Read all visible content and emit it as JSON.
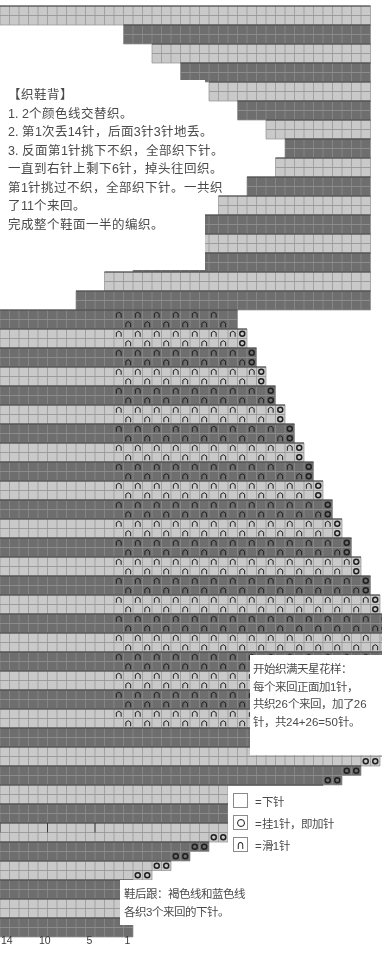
{
  "document": {
    "type": "knitting-chart",
    "title_block": "【织鞋背】"
  },
  "instructions": {
    "heading": "【织鞋背】",
    "lines": [
      "【织鞋背】",
      "1. 2个颜色线交替织。",
      "2. 第1次丢14针，后面3针3针地丢。",
      "3. 反面第1针挑下不织，全部织下针。",
      "一直到右针上剩下6针，掉头往回织。",
      "第1针挑过不织，全部织下针。一共织",
      "了11个来回。",
      "完成整个鞋面一半的编织。"
    ],
    "text": "【织鞋背】\n1. 2个颜色线交替织。\n2. 第1次丢14针，后面3针3针地丢。\n3. 反面第1针挑下不织，全部织下针。\n一直到右针上剩下6针，掉头往回织。\n第1针挑过不织，全部织下针。一共织\n了11个来回。\n完成整个鞋面一半的编织。"
  },
  "star_pattern_note": {
    "lines": [
      "开始织满天星花样：",
      "每个来回正面加1针，",
      "共织26个来回，加了26",
      "针，共24+26=50针。"
    ],
    "text": "开始织满天星花样：\n每个来回正面加1针，\n共织26个来回，加了26\n针，共24+26=50针。"
  },
  "heel_note": {
    "lines": [
      "鞋后跟：褐色线和蓝色线",
      "各织3个来回的下针。"
    ],
    "text": "鞋后跟：褐色线和蓝色线\n各织3个来回的下针。"
  },
  "legend": {
    "items": [
      {
        "symbol": "blank",
        "label": "=下针"
      },
      {
        "symbol": "yarn-over",
        "label": "=挂1针，即加针"
      },
      {
        "symbol": "slip",
        "label": "=滑1针"
      }
    ]
  },
  "x_axis": {
    "ticks": [
      "14",
      "10",
      "5",
      "1"
    ],
    "tick_positions": [
      0,
      4,
      9,
      13
    ]
  },
  "colors": {
    "dark_yarn": "#6e6e6e",
    "light_yarn": "#c9c9c9",
    "grid_line": "#8f8f8f",
    "major_grid_line": "#3c3c3c",
    "background": "#ffffff",
    "symbol": "#1f1f1f",
    "text": "#4a4a4a"
  },
  "chart_data": {
    "type": "heatmap",
    "xlabel": "针数 (stitches)",
    "ylabel": "来回 (rows)",
    "cell_px": 9.5,
    "grid": false,
    "legend_position": "bottom-right",
    "origin_x": 0,
    "origin_y": 6,
    "symbols": {
      "blank": "下针",
      "O": "挂1针，即加针",
      "slip": "滑1针"
    },
    "row_colors_cycle": [
      "dark",
      "dark",
      "light",
      "light"
    ],
    "sections": [
      {
        "name": "top-decrease-staircase",
        "description": "顶部：第1次丢14针，后面3针3针地丢，阶梯状递减",
        "note": "rows listed top to bottom; start=left column index, width=cells",
        "rows": [
          {
            "row": 1,
            "start": 1,
            "width": 39,
            "color": "light"
          },
          {
            "row": 2,
            "start": 1,
            "width": 39,
            "color": "light"
          },
          {
            "row": 3,
            "start": 14,
            "width": 26,
            "color": "dark"
          },
          {
            "row": 4,
            "start": 14,
            "width": 26,
            "color": "dark"
          },
          {
            "row": 5,
            "start": 17,
            "width": 23,
            "color": "light"
          },
          {
            "row": 6,
            "start": 17,
            "width": 23,
            "color": "light"
          },
          {
            "row": 7,
            "start": 20,
            "width": 20,
            "color": "dark"
          },
          {
            "row": 8,
            "start": 20,
            "width": 20,
            "color": "dark"
          },
          {
            "row": 9,
            "start": 23,
            "width": 17,
            "color": "light"
          },
          {
            "row": 10,
            "start": 23,
            "width": 17,
            "color": "light"
          },
          {
            "row": 11,
            "start": 26,
            "width": 14,
            "color": "dark"
          },
          {
            "row": 12,
            "start": 26,
            "width": 14,
            "color": "dark"
          },
          {
            "row": 13,
            "start": 29,
            "width": 11,
            "color": "light"
          },
          {
            "row": 14,
            "start": 29,
            "width": 11,
            "color": "light"
          },
          {
            "row": 15,
            "start": 31,
            "width": 9,
            "color": "dark"
          },
          {
            "row": 16,
            "start": 31,
            "width": 9,
            "color": "dark"
          },
          {
            "row": 17,
            "start": 30,
            "width": 10,
            "color": "light"
          },
          {
            "row": 18,
            "start": 30,
            "width": 10,
            "color": "light"
          },
          {
            "row": 19,
            "start": 27,
            "width": 13,
            "color": "dark"
          },
          {
            "row": 20,
            "start": 27,
            "width": 13,
            "color": "dark"
          },
          {
            "row": 21,
            "start": 24,
            "width": 16,
            "color": "light"
          },
          {
            "row": 22,
            "start": 24,
            "width": 16,
            "color": "light"
          },
          {
            "row": 23,
            "start": 21,
            "width": 19,
            "color": "dark"
          },
          {
            "row": 24,
            "start": 21,
            "width": 19,
            "color": "dark"
          },
          {
            "row": 25,
            "start": 18,
            "width": 22,
            "color": "light"
          },
          {
            "row": 26,
            "start": 18,
            "width": 22,
            "color": "light"
          },
          {
            "row": 27,
            "start": 15,
            "width": 25,
            "color": "dark"
          },
          {
            "row": 28,
            "start": 15,
            "width": 25,
            "color": "dark"
          },
          {
            "row": 29,
            "start": 12,
            "width": 28,
            "color": "light"
          },
          {
            "row": 30,
            "start": 12,
            "width": 28,
            "color": "light"
          },
          {
            "row": 31,
            "start": 9,
            "width": 31,
            "color": "dark"
          },
          {
            "row": 32,
            "start": 9,
            "width": 31,
            "color": "dark"
          }
        ]
      },
      {
        "name": "star-pattern-body",
        "description": "满天星花样主体：每个来回正面加1针，共26个来回",
        "rows_count": 44,
        "left_edge": 1,
        "right_edge_start": 25,
        "right_edge_growth_per_2rows": 1,
        "slip_symbol_columns_offset": 13,
        "slip_symbol_spacing": 2,
        "yarn_over_at_right_edge": true
      },
      {
        "name": "bottom-increase-staircase",
        "description": "底部：每2行在右侧加针（OO），阶梯状递增至14针宽",
        "rows": [
          {
            "row": 1,
            "start": 1,
            "width": 14,
            "color": "dark"
          },
          {
            "row": 2,
            "start": 1,
            "width": 14,
            "color": "dark"
          },
          {
            "row": 3,
            "start": 1,
            "width": 14,
            "color": "light"
          },
          {
            "row": 4,
            "start": 1,
            "width": 14,
            "color": "light"
          },
          {
            "row": 5,
            "start": 1,
            "width": 14,
            "color": "dark"
          },
          {
            "row": 6,
            "start": 1,
            "width": 14,
            "color": "dark"
          }
        ]
      }
    ]
  }
}
